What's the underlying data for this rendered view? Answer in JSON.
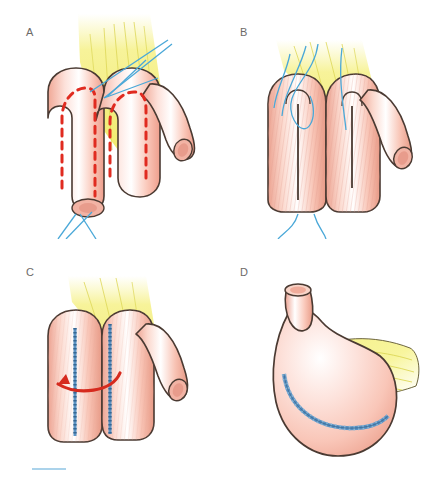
{
  "figure": {
    "background_color": "#ffffff",
    "width": 428,
    "height": 479
  },
  "colors": {
    "bowel_fill": "#f9c9bb",
    "bowel_fill_light": "#fde3dc",
    "bowel_highlight": "#ffffff",
    "bowel_outline": "#4a3a32",
    "mucosa_hatch": "#e39a8a",
    "mesentery_yellow": "#f3ef7a",
    "mesentery_line": "#d8d24e",
    "suture_blue": "#4aa8d8",
    "staple_blue": "#5b93c4",
    "incision_red": "#e02b20",
    "arrow_red": "#d62a1e",
    "label_gray": "#6d6a68",
    "lumen_pink": "#f2b3a4",
    "artifact_blue": "#8fc4e4"
  },
  "panels": [
    {
      "id": "panel-a",
      "label": "A",
      "caption": "Two bowel loops apposed; planned antimesenteric incision marked by red dashed lines; blue stay sutures placed.",
      "elements": [
        "mesentery-fan",
        "bowel-loop-left",
        "bowel-loop-right",
        "distal-limb",
        "incision-dashed-line-left",
        "incision-dashed-line-right",
        "stay-suture-threads",
        "open-bowel-stump"
      ]
    },
    {
      "id": "panel-b",
      "label": "B",
      "caption": "Bowel loops opened along the antimesenteric border exposing mucosa; stay sutures approximate the adjacent edges.",
      "elements": [
        "mesentery-fan",
        "opened-bowel-left",
        "opened-bowel-right",
        "distal-limb",
        "mucosal-surface",
        "incision-slit-left",
        "incision-slit-right",
        "suture-threads"
      ]
    },
    {
      "id": "panel-c",
      "label": "C",
      "caption": "Posterior wall sutured with two running staple lines; red arrow indicates direction of folding of the plate.",
      "elements": [
        "mesentery-fan",
        "sutured-plate",
        "staple-line-left",
        "staple-line-right",
        "folding-arrow",
        "distal-limb"
      ]
    },
    {
      "id": "panel-d",
      "label": "D",
      "caption": "Completed spherical reservoir with curved staple line; efferent limb at the top; mesentery fans posteriorly.",
      "elements": [
        "reservoir-pouch",
        "efferent-limb",
        "limb-lumen",
        "curved-staple-line",
        "mesentery-fan"
      ]
    }
  ],
  "artifact": {
    "name": "scan-edge-blue-line",
    "description": "faint light-blue horizontal scan artifact at lower left"
  }
}
